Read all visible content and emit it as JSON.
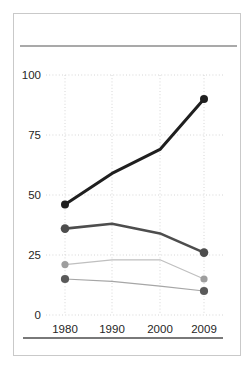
{
  "window": {
    "background_color": "#ffffff",
    "frame_border_color": "#c9c9c9"
  },
  "rules": {
    "top_rule_color": "#8c8c8c",
    "bottom_rule_color": "#4d4d4d"
  },
  "chart_data": {
    "type": "line",
    "title": "",
    "categories": [
      "1980",
      "1990",
      "2000",
      "2009"
    ],
    "y_tick_labels": [
      "0",
      "25",
      "50",
      "75",
      "100"
    ],
    "yticks": [
      0,
      25,
      50,
      75,
      100
    ],
    "ylim": [
      0,
      100
    ],
    "grid": "dotted",
    "gridline_color": "#d6d6d6",
    "legend": "none",
    "series": [
      {
        "name": "line-1-black",
        "color": "#1f1f1f",
        "marker_color": "#1f1f1f",
        "values": [
          46,
          59,
          69,
          90
        ]
      },
      {
        "name": "line-2-dark-gray",
        "color": "#4d4d4d",
        "marker_color": "#4d4d4d",
        "values": [
          36,
          38,
          34,
          26
        ]
      },
      {
        "name": "line-3-light-gray",
        "color": "#bfbfbf",
        "marker_color": "#9e9e9e",
        "values": [
          21,
          23,
          23,
          15
        ]
      },
      {
        "name": "line-4-gray",
        "color": "#a6a6a6",
        "marker_color": "#595959",
        "values": [
          15,
          14,
          12,
          10
        ]
      }
    ]
  }
}
